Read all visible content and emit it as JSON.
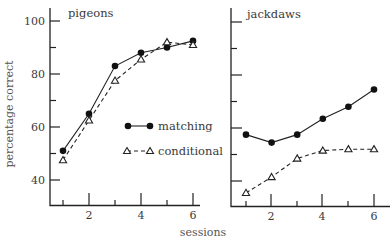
{
  "chart_data": [
    {
      "type": "line",
      "title": "pigeons",
      "xlabel": "sessions",
      "ylabel": "percentage correct",
      "x": [
        1,
        2,
        3,
        4,
        5,
        6
      ],
      "xticks_labeled": [
        2,
        4,
        6
      ],
      "yticks_labeled": [
        40,
        60,
        80,
        100
      ],
      "ylim": [
        30,
        100
      ],
      "grid": false,
      "series": [
        {
          "name": "matching",
          "marker": "filled-circle",
          "linestyle": "solid",
          "values": [
            51,
            65,
            83,
            88,
            90,
            92.5
          ]
        },
        {
          "name": "conditional",
          "marker": "open-triangle",
          "linestyle": "dashed",
          "values": [
            47.5,
            62.5,
            77.5,
            85.5,
            92,
            91
          ]
        }
      ],
      "legend": {
        "position": "inside-right",
        "entries": [
          "matching",
          "conditional"
        ]
      }
    },
    {
      "type": "line",
      "title": "jackdaws",
      "xlabel": "sessions",
      "ylabel": "percentage correct",
      "x": [
        1,
        2,
        3,
        4,
        5,
        6
      ],
      "xticks_labeled": [
        2,
        4,
        6
      ],
      "ylim": [
        30,
        100
      ],
      "grid": false,
      "series": [
        {
          "name": "matching",
          "marker": "filled-circle",
          "linestyle": "solid",
          "values": [
            57.5,
            54.5,
            57.5,
            63.5,
            68,
            74.5
          ]
        },
        {
          "name": "conditional",
          "marker": "open-triangle",
          "linestyle": "dashed",
          "values": [
            35.5,
            41.5,
            48.5,
            51.5,
            52,
            52
          ]
        }
      ]
    }
  ],
  "labels": {
    "ylabel": "percentage correct",
    "xlabel": "sessions",
    "left_title": "pigeons",
    "right_title": "jackdaws",
    "legend_matching": "matching",
    "legend_conditional": "conditional",
    "ytick_100": "100",
    "ytick_80": "80",
    "ytick_60": "60",
    "ytick_40": "40",
    "xtick_2": "2",
    "xtick_4": "4",
    "xtick_6": "6"
  }
}
